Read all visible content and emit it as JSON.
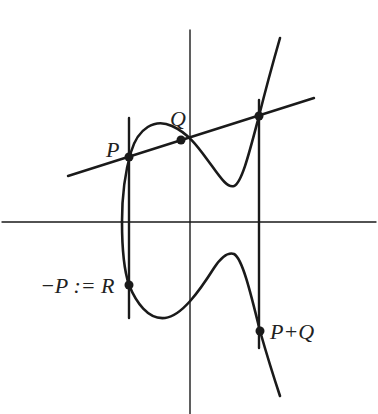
{
  "diagram": {
    "type": "elliptic-curve-group-law",
    "colors": {
      "ink": "#1a1a1a",
      "background": "#ffffff"
    },
    "labels": {
      "P": "P",
      "Q": "Q",
      "R": "−P := R",
      "sum": "P+Q"
    },
    "points": [
      {
        "name": "P",
        "x": 129,
        "y": 157
      },
      {
        "name": "Q",
        "x": 181,
        "y": 140
      },
      {
        "name": "third-intersection",
        "x": 259,
        "y": 116
      },
      {
        "name": "R",
        "x": 129,
        "y": 285
      },
      {
        "name": "P+Q",
        "x": 260,
        "y": 331
      }
    ],
    "lines": [
      {
        "name": "secant-PQ",
        "from": [
          68,
          176
        ],
        "to": [
          314,
          98
        ]
      },
      {
        "name": "vertical-through-P",
        "x": 129,
        "y1": 118,
        "y2": 318
      },
      {
        "name": "vertical-through-third-point",
        "x": 259,
        "y1": 100,
        "y2": 348
      }
    ],
    "axes": {
      "horizontal": {
        "y": 222,
        "x1": 2,
        "x2": 376
      },
      "vertical": {
        "x": 190,
        "y1": 30,
        "y2": 414
      }
    }
  }
}
